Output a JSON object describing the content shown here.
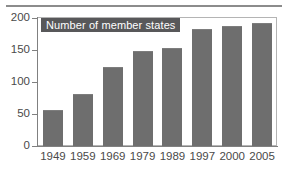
{
  "chart_data": {
    "type": "bar",
    "title": "Number of member states",
    "xlabel": "",
    "ylabel": "",
    "categories": [
      "1949",
      "1959",
      "1969",
      "1979",
      "1989",
      "1997",
      "2000",
      "2005"
    ],
    "values": [
      57,
      81,
      123,
      148,
      153,
      183,
      188,
      192
    ],
    "ylim": [
      0,
      200
    ],
    "yticks": [
      0,
      50,
      100,
      150,
      200
    ],
    "ytick_labels": [
      "0",
      "50",
      "100",
      "150",
      "200"
    ],
    "grid": false,
    "legend": {
      "position": "top-left-inside",
      "entries": [
        "Number of member states"
      ]
    },
    "colors": {
      "bar_fill": "#6e6e6e",
      "legend_background": "#58585a",
      "legend_text": "#ffffff",
      "axis": "#808080",
      "frame": "#b4b4b4",
      "tick_text": "#4a4a4a",
      "rule": "#8c8c8c",
      "background": "#ffffff"
    }
  }
}
